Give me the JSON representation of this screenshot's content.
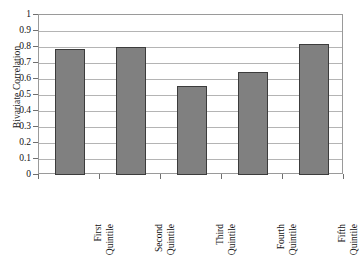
{
  "chart_data": {
    "type": "bar",
    "title": "",
    "xlabel": "",
    "ylabel": "Bivariate Correlation",
    "categories": [
      "First Quintile",
      "Second Quintile",
      "Third Quintile",
      "Fourth Quintile",
      "Fifth Quintile"
    ],
    "category_lines": [
      [
        "First",
        "Quintile"
      ],
      [
        "Second",
        "Quintile"
      ],
      [
        "Third",
        "Quintile"
      ],
      [
        "Fourth",
        "Quintile"
      ],
      [
        "Fifth",
        "Quintile"
      ]
    ],
    "values": [
      0.79,
      0.8,
      0.555,
      0.645,
      0.82
    ],
    "ylim": [
      0,
      1
    ],
    "ytick_labels": [
      "0",
      "0.1",
      "0.2",
      "0.3",
      "0.4",
      "0.5",
      "0.6",
      "0.7",
      "0.8",
      "0.9",
      "1"
    ],
    "ytick_values": [
      0,
      0.1,
      0.2,
      0.3,
      0.4,
      0.5,
      0.6,
      0.7,
      0.8,
      0.9,
      1
    ],
    "grid": true,
    "grid_axis": "y",
    "legend": false,
    "legend_position": "none",
    "bar_color": "#808080",
    "bar_border_color": "#3c3c3c",
    "grid_color": "#b4b4b4",
    "axis_color": "#9a9a9a",
    "background_color": "#ffffff",
    "text_color": "#111111"
  }
}
